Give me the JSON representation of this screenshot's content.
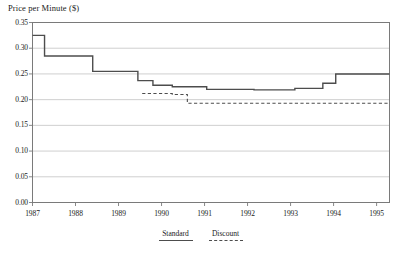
{
  "chart_data": {
    "type": "line",
    "title": "Price per Minute ($)",
    "xlabel": "",
    "ylabel": "Price per Minute ($)",
    "xlim": [
      1987,
      1995.3
    ],
    "ylim": [
      0.0,
      0.35
    ],
    "grid": true,
    "step_style": "post",
    "legend_position": "bottom-center",
    "x_tick_labels": [
      "1987",
      "1988",
      "1989",
      "1990",
      "1991",
      "1992",
      "1993",
      "1994",
      "1995"
    ],
    "x_tick_values": [
      1987,
      1988,
      1989,
      1990,
      1991,
      1992,
      1993,
      1994,
      1995
    ],
    "y_tick_labels": [
      "0.00",
      "0.05",
      "0.10",
      "0.15",
      "0.20",
      "0.25",
      "0.30",
      "0.35"
    ],
    "y_tick_values": [
      0.0,
      0.05,
      0.1,
      0.15,
      0.2,
      0.25,
      0.3,
      0.35
    ],
    "series": [
      {
        "name": "Standard",
        "style": "solid",
        "color": "#4d4d4d",
        "x": [
          1987.0,
          1987.28,
          1988.4,
          1989.45,
          1989.8,
          1990.25,
          1991.05,
          1992.15,
          1993.1,
          1993.75,
          1994.05,
          1995.3
        ],
        "values": [
          0.325,
          0.285,
          0.255,
          0.237,
          0.228,
          0.225,
          0.22,
          0.219,
          0.222,
          0.232,
          0.25,
          0.25
        ]
      },
      {
        "name": "Discount",
        "style": "dashed",
        "color": "#4d4d4d",
        "x": [
          1989.55,
          1990.25,
          1990.6,
          1995.3
        ],
        "values": [
          0.212,
          0.21,
          0.193,
          0.193
        ]
      }
    ]
  },
  "legend": {
    "items": [
      {
        "label": "Standard",
        "key": "solid-line-key"
      },
      {
        "label": "Discount",
        "key": "dashed-line-key"
      }
    ]
  }
}
